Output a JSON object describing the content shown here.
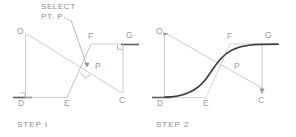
{
  "figure": {
    "background_color": "#ffffff",
    "thin_line_color": "#b4b4b4",
    "mid_line_color": "#9e9e9e",
    "heavy_line_color": "#6e6e6e",
    "curve_color": "#3a3a3a",
    "label_color": "#8d8d8d"
  },
  "annotation": {
    "line1": "SELECT",
    "line2": "PT. P"
  },
  "panels": [
    {
      "id": "step1",
      "caption": "STEP I",
      "points": [
        {
          "name": "O",
          "label": "O"
        },
        {
          "name": "D",
          "label": "D"
        },
        {
          "name": "E",
          "label": "E"
        },
        {
          "name": "P",
          "label": "P"
        },
        {
          "name": "F",
          "label": "F"
        },
        {
          "name": "G",
          "label": "G"
        },
        {
          "name": "C",
          "label": "C"
        }
      ],
      "markers": [
        "right-angle-at-D",
        "right-angle-at-G",
        "right-angle-at-P"
      ],
      "has_curve": false
    },
    {
      "id": "step2",
      "caption": "STEP 2",
      "points": [
        {
          "name": "O",
          "label": "O"
        },
        {
          "name": "D",
          "label": "D"
        },
        {
          "name": "E",
          "label": "E"
        },
        {
          "name": "P",
          "label": "P"
        },
        {
          "name": "F",
          "label": "F"
        },
        {
          "name": "G",
          "label": "G"
        },
        {
          "name": "C",
          "label": "C"
        }
      ],
      "markers": [
        "arrow-at-O",
        "arrow-at-C"
      ],
      "has_curve": true
    }
  ]
}
